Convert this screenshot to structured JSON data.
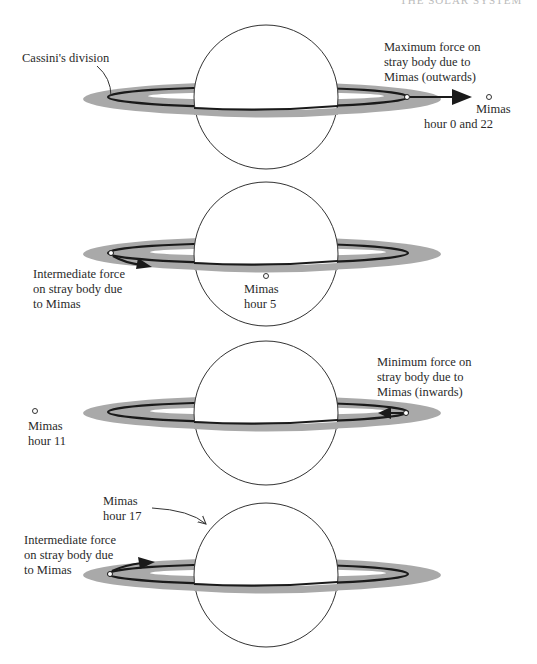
{
  "header": {
    "text": "THE SOLAR SYSTEM"
  },
  "colors": {
    "ring": "#a9a9a9",
    "orbit": "#1a1a1a",
    "planet_stroke": "#333333",
    "background": "#ffffff",
    "text": "#2a2a2a"
  },
  "panels": [
    {
      "id": "hour-0",
      "annotation": "Cassini's division",
      "force_label": [
        "Maximum force on",
        "stray body due to",
        "Mimas (outwards)"
      ],
      "force_type": "maximum",
      "force_direction": "outwards",
      "mimas_label": [
        "Mimas",
        "hour 0 and 22"
      ]
    },
    {
      "id": "hour-5",
      "force_label": [
        "Intermediate force",
        "on stray body due",
        "to Mimas"
      ],
      "force_type": "intermediate",
      "mimas_label": [
        "Mimas",
        "hour 5"
      ]
    },
    {
      "id": "hour-11",
      "force_label": [
        "Minimum force on",
        "stray body due to",
        "Mimas (inwards)"
      ],
      "force_type": "minimum",
      "force_direction": "inwards",
      "mimas_label": [
        "Mimas",
        "hour 11"
      ]
    },
    {
      "id": "hour-17",
      "force_label": [
        "Intermediate force",
        "on stray body due",
        "to Mimas"
      ],
      "force_type": "intermediate",
      "mimas_label": [
        "Mimas",
        "hour 17"
      ]
    }
  ]
}
